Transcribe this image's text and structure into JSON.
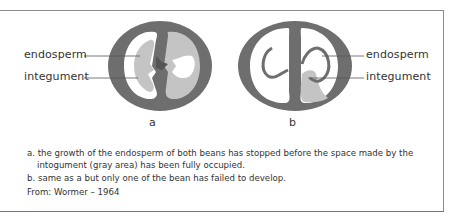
{
  "figure": {
    "colors": {
      "integument": "#6e6e6e",
      "endosperm": "#c4c4c4",
      "void": "#ffffff",
      "frame": "#8a8a8a",
      "text": "#333333"
    },
    "panel_a": {
      "label": "a",
      "callouts": {
        "endosperm": "endosperm",
        "integument": "integument"
      }
    },
    "panel_b": {
      "label": "b",
      "callouts": {
        "endosperm": "endosperm",
        "integument": "integument"
      }
    }
  },
  "caption": {
    "a_line1": "a. the growth of the endosperm of both beans has stopped before the space made by the",
    "a_line2": "intogument (gray area) has been fully occupied.",
    "b_line": "b. same as a but only one of the bean has failed  to develop."
  },
  "source": "From: Wormer – 1964"
}
